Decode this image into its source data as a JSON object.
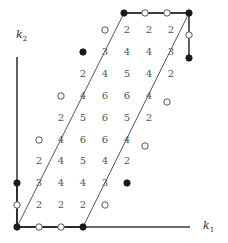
{
  "figure": {
    "title": "",
    "background": "#ffffff",
    "axis_color": "#3a3a3a",
    "polygon_color": "#555555",
    "number_color": "#555555",
    "filled_vertex_color": "#1a1a1a",
    "open_vertex_color": "#ffffff",
    "open_vertex_stroke": "#555555"
  },
  "axes": {
    "x": {
      "label": "k",
      "subscript": "1",
      "x": 203,
      "y": 219
    },
    "y": {
      "label": "k",
      "subscript": "2",
      "x": 16,
      "y": 28
    },
    "origin": {
      "x": 17,
      "y": 227
    },
    "step": 22,
    "x_axis_end": 190,
    "y_axis_top": 57
  },
  "chart_data": {
    "type": "scatter",
    "title": "",
    "xlabel": "k1",
    "ylabel": "k2",
    "grid": false,
    "legend": null,
    "lattice_step": 22,
    "numbers": [
      {
        "value": "2",
        "x": 127,
        "y": 30
      },
      {
        "value": "2",
        "x": 149,
        "y": 30
      },
      {
        "value": "2",
        "x": 171,
        "y": 30
      },
      {
        "value": "3",
        "x": 105,
        "y": 52
      },
      {
        "value": "4",
        "x": 127,
        "y": 52
      },
      {
        "value": "4",
        "x": 149,
        "y": 52
      },
      {
        "value": "3",
        "x": 171,
        "y": 52
      },
      {
        "value": "2",
        "x": 83,
        "y": 74
      },
      {
        "value": "4",
        "x": 105,
        "y": 74
      },
      {
        "value": "5",
        "x": 127,
        "y": 74
      },
      {
        "value": "4",
        "x": 149,
        "y": 74
      },
      {
        "value": "2",
        "x": 171,
        "y": 74
      },
      {
        "value": "4",
        "x": 83,
        "y": 96
      },
      {
        "value": "6",
        "x": 105,
        "y": 96
      },
      {
        "value": "6",
        "x": 127,
        "y": 96
      },
      {
        "value": "4",
        "x": 149,
        "y": 96
      },
      {
        "value": "2",
        "x": 61,
        "y": 118
      },
      {
        "value": "5",
        "x": 83,
        "y": 118
      },
      {
        "value": "6",
        "x": 105,
        "y": 118
      },
      {
        "value": "5",
        "x": 127,
        "y": 118
      },
      {
        "value": "2",
        "x": 149,
        "y": 118
      },
      {
        "value": "4",
        "x": 61,
        "y": 140
      },
      {
        "value": "6",
        "x": 83,
        "y": 140
      },
      {
        "value": "6",
        "x": 105,
        "y": 140
      },
      {
        "value": "4",
        "x": 127,
        "y": 140
      },
      {
        "value": "2",
        "x": 39,
        "y": 161
      },
      {
        "value": "4",
        "x": 61,
        "y": 161
      },
      {
        "value": "5",
        "x": 83,
        "y": 161
      },
      {
        "value": "4",
        "x": 105,
        "y": 161
      },
      {
        "value": "2",
        "x": 127,
        "y": 161
      },
      {
        "value": "3",
        "x": 39,
        "y": 183
      },
      {
        "value": "4",
        "x": 61,
        "y": 183
      },
      {
        "value": "4",
        "x": 83,
        "y": 183
      },
      {
        "value": "3",
        "x": 105,
        "y": 183
      },
      {
        "value": "2",
        "x": 39,
        "y": 205
      },
      {
        "value": "2",
        "x": 61,
        "y": 205
      },
      {
        "value": "2",
        "x": 83,
        "y": 205
      }
    ],
    "polygon_path": "M 17,227 L 83,227 L 189,13 L 124,13 L 17,227 Z",
    "boundary_points": [
      {
        "x": 17,
        "y": 227,
        "type": "filled"
      },
      {
        "x": 39,
        "y": 227,
        "type": "open"
      },
      {
        "x": 61,
        "y": 227,
        "type": "open"
      },
      {
        "x": 83,
        "y": 227,
        "type": "filled"
      },
      {
        "x": 105,
        "y": 205,
        "type": "open"
      },
      {
        "x": 127,
        "y": 183,
        "type": "filled"
      },
      {
        "x": 145,
        "y": 146,
        "type": "open"
      },
      {
        "x": 167,
        "y": 102,
        "type": "open"
      },
      {
        "x": 189,
        "y": 58,
        "type": "filled"
      },
      {
        "x": 189,
        "y": 35,
        "type": "open"
      },
      {
        "x": 189,
        "y": 13,
        "type": "filled"
      },
      {
        "x": 167,
        "y": 13,
        "type": "open"
      },
      {
        "x": 145,
        "y": 13,
        "type": "open"
      },
      {
        "x": 124,
        "y": 13,
        "type": "filled"
      },
      {
        "x": 105,
        "y": 30,
        "type": "open"
      },
      {
        "x": 83,
        "y": 52,
        "type": "filled"
      },
      {
        "x": 61,
        "y": 96,
        "type": "open"
      },
      {
        "x": 39,
        "y": 140,
        "type": "open"
      },
      {
        "x": 17,
        "y": 183,
        "type": "filled"
      },
      {
        "x": 17,
        "y": 205,
        "type": "open"
      }
    ]
  }
}
